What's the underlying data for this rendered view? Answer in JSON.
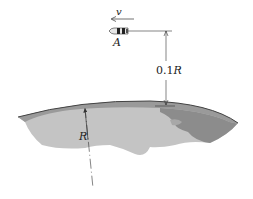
{
  "diagram": {
    "velocity_label": "v",
    "object_label": "A",
    "altitude_label_num": "0.1",
    "altitude_label_var": "R",
    "radius_label": "R"
  },
  "colors": {
    "line": "#333333",
    "earth_dark": "#8c8c8c",
    "earth_mid": "#a6a6a6",
    "earth_light": "#c4c4c4",
    "earth_edge": "#555555"
  }
}
